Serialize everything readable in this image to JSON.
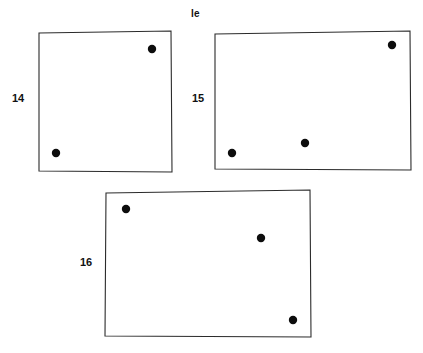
{
  "figure": {
    "background_color": "#ffffff",
    "outline_color": "#2b2b2b",
    "dot_color": "#0d0d0d",
    "label_color": "#111111",
    "top_caption": "le",
    "top_caption_position": {
      "x": 191,
      "y": 9
    },
    "panels": [
      {
        "id": "panel-14",
        "label": "14",
        "label_position": {
          "x": 12,
          "y": 93
        },
        "outline_points": "39,33 171,31 172,172 39,171",
        "dot_radius": 4.2,
        "dots": [
          {
            "name": "dot-top-right",
            "x": 152,
            "y": 49
          },
          {
            "name": "dot-bottom-left",
            "x": 56,
            "y": 153
          }
        ]
      },
      {
        "id": "panel-15",
        "label": "15",
        "label_position": {
          "x": 192,
          "y": 93
        },
        "outline_points": "215,34 410,31 411,170 215,169",
        "dot_radius": 4.2,
        "dots": [
          {
            "name": "dot-top-right",
            "x": 392,
            "y": 45
          },
          {
            "name": "dot-middle",
            "x": 305,
            "y": 143
          },
          {
            "name": "dot-bottom-left",
            "x": 232,
            "y": 153
          }
        ]
      },
      {
        "id": "panel-16",
        "label": "16",
        "label_position": {
          "x": 80,
          "y": 257
        },
        "outline_points": "106,193 310,190 311,337 105,336",
        "dot_radius": 4.2,
        "dots": [
          {
            "name": "dot-top-left",
            "x": 126,
            "y": 209
          },
          {
            "name": "dot-middle-right",
            "x": 261,
            "y": 238
          },
          {
            "name": "dot-bottom-right",
            "x": 293,
            "y": 320
          }
        ]
      }
    ]
  }
}
